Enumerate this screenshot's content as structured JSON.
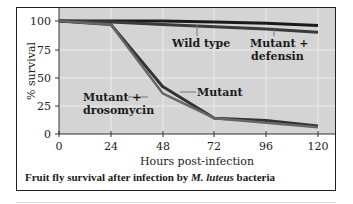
{
  "chart_data": {
    "type": "line",
    "caption_parts": {
      "prefix": "Fruit fly survival after infection by",
      "species": "M. luteus",
      "suffix": "bacteria"
    },
    "xlabel": "Hours post-infection",
    "ylabel": "% survival",
    "x": [
      0,
      24,
      48,
      72,
      96,
      120
    ],
    "x_ticks": [
      "0",
      "24",
      "48",
      "72",
      "96",
      "120"
    ],
    "y_ticks": [
      "0",
      "25",
      "50",
      "75",
      "100"
    ],
    "xlim": [
      0,
      120
    ],
    "ylim": [
      0,
      100
    ],
    "grid": true,
    "series": [
      {
        "name": "Wild type",
        "values": [
          100,
          100,
          100,
          99,
          98,
          96
        ],
        "color": "#1a1a1a"
      },
      {
        "name": "Mutant + defensin",
        "values": [
          100,
          99,
          97,
          95,
          93,
          90
        ],
        "color": "#3a3a3a"
      },
      {
        "name": "Mutant",
        "values": [
          100,
          97,
          42,
          14,
          12,
          7
        ],
        "color": "#333333"
      },
      {
        "name": "Mutant + drosomycin",
        "values": [
          100,
          97,
          36,
          14,
          10,
          6
        ],
        "color": "#666666"
      }
    ],
    "annotations": [
      {
        "text": "Wild type",
        "target": "Wild type"
      },
      {
        "text": "Mutant +",
        "text2": "defensin",
        "target": "Mutant + defensin"
      },
      {
        "text": "Mutant",
        "target": "Mutant"
      },
      {
        "text": "Mutant +",
        "text2": "drosomycin",
        "target": "Mutant + drosomycin"
      }
    ]
  }
}
